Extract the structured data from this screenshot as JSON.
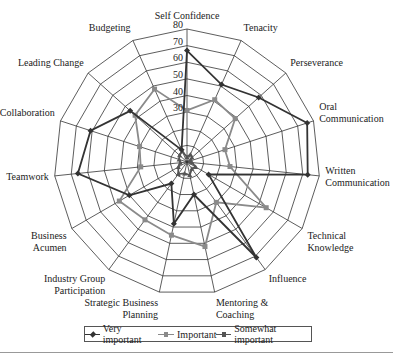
{
  "chart_data": {
    "type": "radar",
    "title": "",
    "axis_range": [
      0,
      80
    ],
    "ticks": [
      0,
      10,
      20,
      30,
      40,
      50,
      60,
      70,
      80
    ],
    "tick_labels_shown": [
      "30",
      "40",
      "50",
      "60",
      "70",
      "80"
    ],
    "grid": true,
    "legend_position": "bottom",
    "categories": [
      "Self Confidence",
      "Tenacity",
      "Perseverance",
      "Oral Communication",
      "Written Communication",
      "Technical Knowledge",
      "Influence",
      "Mentoring & Coaching",
      "Strategic Business Planning",
      "Industry Group Participation",
      "Business Acumen",
      "Teamwork",
      "Collaboration",
      "Leading Change",
      "Budgeting"
    ],
    "category_labels": [
      [
        "Self Confidence"
      ],
      [
        "Tenacity"
      ],
      [
        "Perseverance"
      ],
      [
        "Oral",
        "Communication"
      ],
      [
        "Written",
        "Communication"
      ],
      [
        "Technical",
        "Knowledge"
      ],
      [
        "Influence"
      ],
      [
        "Mentoring &",
        "Coaching"
      ],
      [
        "Strategic Business",
        "Planning"
      ],
      [
        "Industry Group",
        "Participation"
      ],
      [
        "Business",
        "Acumen"
      ],
      [
        "Teamwork"
      ],
      [
        "Collaboration"
      ],
      [
        "Leading Change"
      ],
      [
        "Budgeting"
      ]
    ],
    "series": [
      {
        "name": "Very important",
        "color": "#333333",
        "marker": "diamond",
        "values": [
          67,
          51,
          58,
          76,
          73,
          15,
          71,
          20,
          38,
          16,
          40,
          66,
          61,
          46,
          8
        ]
      },
      {
        "name": "Important",
        "color": "#8a8a8a",
        "marker": "square",
        "values": [
          31,
          41,
          39,
          24,
          26,
          55,
          30,
          52,
          45,
          43,
          47,
          28,
          30,
          42,
          48
        ]
      },
      {
        "name": "Somewhat important",
        "color": "#555555",
        "marker": "triangle",
        "values": [
          3,
          5,
          4,
          2,
          3,
          6,
          5,
          8,
          7,
          9,
          6,
          4,
          5,
          6,
          7
        ]
      }
    ]
  },
  "legend": {
    "items": [
      {
        "label": "Very important"
      },
      {
        "label": "Important"
      },
      {
        "label": "Somewhat important"
      }
    ]
  }
}
